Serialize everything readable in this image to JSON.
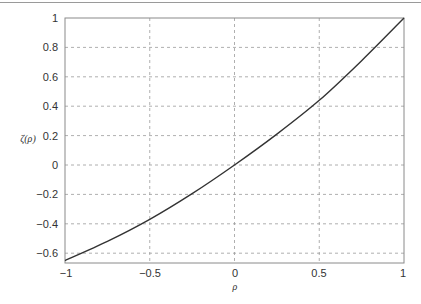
{
  "chart_data": {
    "type": "line",
    "title": "",
    "xlabel": "ρ",
    "ylabel": "ζ(ρ)",
    "xlim": [
      -1,
      1
    ],
    "ylim": [
      -0.65,
      1
    ],
    "grid": true,
    "grid_style": "dashed",
    "x_ticks": [
      "-1",
      "-0.5",
      "0",
      "0.5",
      "1"
    ],
    "y_ticks": [
      "-0.6",
      "-0.4",
      "-0.2",
      "0",
      "0.2",
      "0.4",
      "0.6",
      "0.8",
      "1"
    ],
    "series": [
      {
        "name": "ζ(ρ)",
        "color": "#333333",
        "x": [
          -1,
          -0.75,
          -0.5,
          -0.25,
          0,
          0.25,
          0.5,
          0.75,
          1
        ],
        "values": [
          -0.65,
          -0.52,
          -0.37,
          -0.195,
          0,
          0.21,
          0.44,
          0.71,
          1
        ]
      }
    ]
  },
  "labels": {
    "xlabel": "ρ",
    "ylabel": "ζ(ρ)",
    "x_ticks": [
      "−1",
      "−0.5",
      "0",
      "0.5",
      "1"
    ],
    "y_ticks": [
      "1",
      "0.8",
      "0.6",
      "0.4",
      "0.2",
      "0",
      "−0.2",
      "−0.4",
      "−0.6"
    ]
  }
}
